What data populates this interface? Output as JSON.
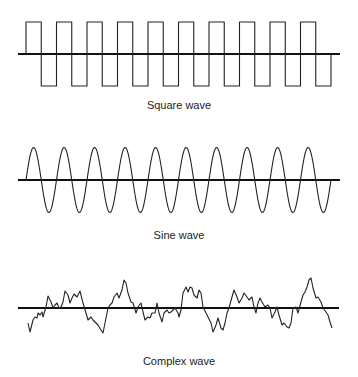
{
  "panels": [
    {
      "id": "square",
      "label": "Square wave",
      "label_y": 99,
      "axis": {
        "x1": 18,
        "x2": 340,
        "y": 54
      },
      "type": "square",
      "start_x": 26,
      "end_x": 331,
      "periods": 10,
      "high_y": 22,
      "low_y": 86
    },
    {
      "id": "sine",
      "label": "Sine wave",
      "label_y": 229,
      "axis": {
        "x1": 18,
        "x2": 340,
        "y": 180
      },
      "type": "sine",
      "start_x": 26,
      "end_x": 331,
      "periods": 10,
      "amplitude": 32.5
    },
    {
      "id": "complex",
      "label": "Complex wave",
      "label_y": 355,
      "axis": {
        "x1": 18,
        "x2": 339,
        "y": 308
      },
      "type": "points",
      "points": [
        [
          28,
          323
        ],
        [
          30,
          332
        ],
        [
          33,
          320
        ],
        [
          35,
          317
        ],
        [
          37,
          318
        ],
        [
          38,
          313
        ],
        [
          40,
          315
        ],
        [
          42,
          312
        ],
        [
          43,
          317
        ],
        [
          46,
          307
        ],
        [
          48,
          296
        ],
        [
          51,
          302
        ],
        [
          53,
          308
        ],
        [
          55,
          305
        ],
        [
          57,
          303
        ],
        [
          59,
          308
        ],
        [
          61,
          307
        ],
        [
          63,
          302
        ],
        [
          65,
          291
        ],
        [
          68,
          295
        ],
        [
          70,
          303
        ],
        [
          72,
          298
        ],
        [
          74,
          294
        ],
        [
          77,
          297
        ],
        [
          80,
          291
        ],
        [
          83,
          303
        ],
        [
          86,
          313
        ],
        [
          88,
          320
        ],
        [
          91,
          317
        ],
        [
          93,
          320
        ],
        [
          96,
          323
        ],
        [
          98,
          325
        ],
        [
          101,
          330
        ],
        [
          103,
          333
        ],
        [
          105,
          323
        ],
        [
          108,
          308
        ],
        [
          110,
          305
        ],
        [
          112,
          303
        ],
        [
          114,
          297
        ],
        [
          117,
          293
        ],
        [
          119,
          298
        ],
        [
          122,
          290
        ],
        [
          124,
          280
        ],
        [
          126,
          283
        ],
        [
          128,
          293
        ],
        [
          131,
          302
        ],
        [
          133,
          303
        ],
        [
          136,
          313
        ],
        [
          138,
          307
        ],
        [
          141,
          303
        ],
        [
          143,
          312
        ],
        [
          145,
          320
        ],
        [
          148,
          317
        ],
        [
          150,
          318
        ],
        [
          152,
          313
        ],
        [
          155,
          313
        ],
        [
          157,
          303
        ],
        [
          159,
          313
        ],
        [
          162,
          322
        ],
        [
          164,
          313
        ],
        [
          167,
          310
        ],
        [
          169,
          313
        ],
        [
          171,
          312
        ],
        [
          173,
          310
        ],
        [
          175,
          308
        ],
        [
          178,
          313
        ],
        [
          179,
          317
        ],
        [
          181,
          310
        ],
        [
          183,
          293
        ],
        [
          186,
          287
        ],
        [
          188,
          292
        ],
        [
          190,
          287
        ],
        [
          192,
          288
        ],
        [
          194,
          295
        ],
        [
          197,
          298
        ],
        [
          199,
          290
        ],
        [
          201,
          293
        ],
        [
          203,
          307
        ],
        [
          206,
          313
        ],
        [
          208,
          317
        ],
        [
          211,
          323
        ],
        [
          213,
          332
        ],
        [
          216,
          325
        ],
        [
          218,
          318
        ],
        [
          221,
          328
        ],
        [
          223,
          330
        ],
        [
          225,
          323
        ],
        [
          227,
          313
        ],
        [
          229,
          308
        ],
        [
          232,
          297
        ],
        [
          234,
          290
        ],
        [
          237,
          297
        ],
        [
          239,
          303
        ],
        [
          242,
          298
        ],
        [
          244,
          293
        ],
        [
          247,
          297
        ],
        [
          249,
          300
        ],
        [
          252,
          297
        ],
        [
          254,
          307
        ],
        [
          256,
          313
        ],
        [
          258,
          303
        ],
        [
          260,
          298
        ],
        [
          262,
          302
        ],
        [
          265,
          307
        ],
        [
          268,
          305
        ],
        [
          270,
          308
        ],
        [
          272,
          318
        ],
        [
          275,
          312
        ],
        [
          277,
          307
        ],
        [
          279,
          315
        ],
        [
          282,
          325
        ],
        [
          284,
          323
        ],
        [
          287,
          327
        ],
        [
          289,
          328
        ],
        [
          291,
          323
        ],
        [
          293,
          308
        ],
        [
          296,
          307
        ],
        [
          298,
          313
        ],
        [
          301,
          302
        ],
        [
          303,
          295
        ],
        [
          305,
          292
        ],
        [
          307,
          287
        ],
        [
          309,
          280
        ],
        [
          311,
          278
        ],
        [
          313,
          288
        ],
        [
          316,
          298
        ],
        [
          318,
          297
        ],
        [
          321,
          302
        ],
        [
          323,
          308
        ],
        [
          326,
          312
        ],
        [
          328,
          315
        ],
        [
          330,
          322
        ],
        [
          332,
          328
        ]
      ]
    }
  ],
  "colors": {
    "axis": "#111111",
    "wave": "#222222",
    "background": "#ffffff"
  }
}
